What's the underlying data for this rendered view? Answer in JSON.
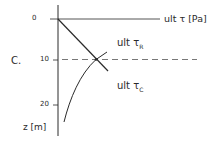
{
  "figure": {
    "panel_label": "C.",
    "x_axis_label": "ult τ [Pa]",
    "y_axis_label": "z [m]",
    "y_ticks": [
      "0",
      "10",
      "20"
    ],
    "curves": [
      {
        "name": "ult τR",
        "base": "ult τ",
        "subscript": "R",
        "shape": "straight line, increasing with depth"
      },
      {
        "name": "ult τC",
        "base": "ult τ",
        "subscript": "C",
        "shape": "concave curve, decreasing with depth"
      }
    ],
    "intersection_depth": "≈9.5 m",
    "reference_line": "dashed horizontal line at intersection depth"
  },
  "labels": {
    "panel": "C.",
    "xaxis": "ult τ [Pa]",
    "zaxis": "z [m]",
    "tick0": "0",
    "tick10": "10",
    "tick20": "20",
    "tauR_base": "ult τ",
    "tauR_sub": "R",
    "tauC_base": "ult τ",
    "tauC_sub": "C"
  }
}
